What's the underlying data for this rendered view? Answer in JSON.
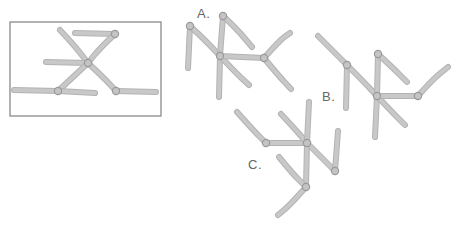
{
  "diagram": {
    "colors": {
      "branch": "#c8c8c8",
      "branch_edge": "#b3b3b3",
      "node": "#c4c4c4",
      "frame": "#8a8a8a",
      "label": "#666666"
    },
    "reference": {
      "frame": {
        "x": 10,
        "y": 22,
        "w": 151,
        "h": 94
      },
      "nodes": [
        [
          88,
          63
        ],
        [
          115,
          34
        ],
        [
          58,
          91
        ],
        [
          116,
          91
        ]
      ],
      "branches": [
        [
          [
            60,
            30
          ],
          [
            74,
            45
          ],
          [
            88,
            63
          ]
        ],
        [
          [
            75,
            33
          ],
          [
            115,
            34
          ]
        ],
        [
          [
            115,
            34
          ],
          [
            100,
            48
          ],
          [
            88,
            63
          ]
        ],
        [
          [
            46,
            62
          ],
          [
            88,
            63
          ]
        ],
        [
          [
            88,
            63
          ],
          [
            72,
            78
          ],
          [
            58,
            91
          ]
        ],
        [
          [
            14,
            90
          ],
          [
            58,
            91
          ]
        ],
        [
          [
            58,
            91
          ],
          [
            95,
            93
          ]
        ],
        [
          [
            88,
            63
          ],
          [
            104,
            78
          ],
          [
            116,
            91
          ]
        ],
        [
          [
            116,
            91
          ],
          [
            156,
            92
          ]
        ]
      ]
    },
    "figures": [
      {
        "label": "A.",
        "label_pos": {
          "x": 197,
          "y": 6
        },
        "nodes": [
          [
            190,
            26
          ],
          [
            223,
            16
          ],
          [
            220,
            56
          ],
          [
            264,
            58
          ]
        ],
        "branches": [
          [
            [
              190,
              26
            ],
            [
              188,
              68
            ]
          ],
          [
            [
              190,
              26
            ],
            [
              205,
              40
            ],
            [
              220,
              56
            ]
          ],
          [
            [
              223,
              16
            ],
            [
              220,
              56
            ]
          ],
          [
            [
              223,
              16
            ],
            [
              236,
              28
            ],
            [
              252,
              47
            ]
          ],
          [
            [
              220,
              56
            ],
            [
              219,
              97
            ]
          ],
          [
            [
              220,
              56
            ],
            [
              236,
              73
            ],
            [
              249,
              85
            ]
          ],
          [
            [
              220,
              56
            ],
            [
              264,
              58
            ]
          ],
          [
            [
              264,
              58
            ],
            [
              280,
              40
            ],
            [
              290,
              33
            ]
          ],
          [
            [
              264,
              58
            ],
            [
              278,
              75
            ],
            [
              291,
              89
            ]
          ]
        ]
      },
      {
        "label": "B.",
        "label_pos": {
          "x": 322,
          "y": 89
        },
        "nodes": [
          [
            347,
            65
          ],
          [
            378,
            54
          ],
          [
            377,
            96
          ],
          [
            418,
            96
          ]
        ],
        "branches": [
          [
            [
              318,
              36
            ],
            [
              334,
              52
            ],
            [
              347,
              65
            ]
          ],
          [
            [
              347,
              65
            ],
            [
              346,
              108
            ]
          ],
          [
            [
              347,
              65
            ],
            [
              362,
              80
            ],
            [
              377,
              96
            ]
          ],
          [
            [
              378,
              54
            ],
            [
              377,
              96
            ]
          ],
          [
            [
              378,
              54
            ],
            [
              392,
              67
            ],
            [
              407,
              82
            ]
          ],
          [
            [
              377,
              96
            ],
            [
              375,
              137
            ]
          ],
          [
            [
              377,
              96
            ],
            [
              392,
              112
            ],
            [
              405,
              125
            ]
          ],
          [
            [
              377,
              96
            ],
            [
              418,
              96
            ]
          ],
          [
            [
              418,
              96
            ],
            [
              432,
              80
            ],
            [
              448,
              67
            ]
          ]
        ]
      },
      {
        "label": "C.",
        "label_pos": {
          "x": 248,
          "y": 157
        },
        "nodes": [
          [
            266,
            143
          ],
          [
            307,
            143
          ],
          [
            335,
            171
          ],
          [
            306,
            187
          ]
        ],
        "branches": [
          [
            [
              237,
              112
            ],
            [
              253,
              130
            ],
            [
              266,
              143
            ]
          ],
          [
            [
              266,
              143
            ],
            [
              307,
              143
            ]
          ],
          [
            [
              281,
              114
            ],
            [
              295,
              129
            ],
            [
              307,
              143
            ]
          ],
          [
            [
              309,
              102
            ],
            [
              307,
              143
            ]
          ],
          [
            [
              307,
              143
            ],
            [
              322,
              158
            ],
            [
              335,
              171
            ]
          ],
          [
            [
              338,
              131
            ],
            [
              335,
              171
            ]
          ],
          [
            [
              307,
              143
            ],
            [
              306,
              187
            ]
          ],
          [
            [
              279,
              157
            ],
            [
              292,
              173
            ],
            [
              306,
              187
            ]
          ],
          [
            [
              306,
              187
            ],
            [
              290,
              205
            ],
            [
              278,
              215
            ]
          ]
        ]
      }
    ]
  }
}
